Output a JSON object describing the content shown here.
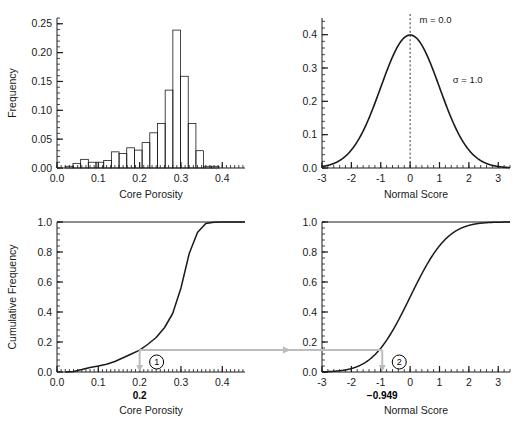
{
  "figure": {
    "title": "",
    "background": "#ffffff",
    "line_color": "#1a1a1a",
    "arrow_color": "#b3b3b3"
  },
  "panels": {
    "top_left": {
      "name": "core-porosity-histogram",
      "xlabel": "Core Porosity",
      "ylabel": "Frequency",
      "xticks": [
        "0.0",
        "0.1",
        "0.2",
        "0.3",
        "0.4"
      ],
      "yticks": [
        "0.00",
        "0.05",
        "0.10",
        "0.15",
        "0.20",
        "0.25"
      ]
    },
    "top_right": {
      "name": "normal-score-pdf",
      "xlabel": "Normal Score",
      "ylabel": "",
      "xticks": [
        "-3",
        "-2",
        "-1",
        "0",
        "1",
        "2",
        "3"
      ],
      "yticks": [
        "0.0",
        "0.1",
        "0.2",
        "0.3",
        "0.4"
      ],
      "annotation_mean": "m = 0.0",
      "annotation_sigma": "σ = 1.0"
    },
    "bottom_left": {
      "name": "core-porosity-cdf",
      "xlabel": "Core Porosity",
      "ylabel": "Cumulative Frequency",
      "xticks": [
        "0.0",
        "0.1",
        "0.2",
        "0.3",
        "0.4"
      ],
      "yticks": [
        "0.0",
        "0.2",
        "0.4",
        "0.6",
        "0.8",
        "1.0"
      ],
      "marker_label": "0.2",
      "step_number": "1"
    },
    "bottom_right": {
      "name": "normal-score-cdf",
      "xlabel": "Normal Score",
      "ylabel": "",
      "xticks": [
        "-3",
        "-2",
        "-1",
        "0",
        "1",
        "2",
        "3"
      ],
      "yticks": [
        "0.0",
        "0.2",
        "0.4",
        "0.6",
        "0.8",
        "1.0"
      ],
      "marker_label": "−0.949",
      "step_number": "2"
    }
  },
  "chart_data": [
    {
      "type": "bar",
      "id": "core-porosity-histogram",
      "title": "",
      "xlabel": "Core Porosity",
      "ylabel": "Frequency",
      "xlim": [
        0.0,
        0.455
      ],
      "ylim": [
        0.0,
        0.26
      ],
      "grid": false,
      "legend": false,
      "bin_width": 0.0186,
      "bin_starts": [
        0.02,
        0.0386,
        0.0572,
        0.0758,
        0.0944,
        0.113,
        0.1316,
        0.1502,
        0.1688,
        0.1874,
        0.206,
        0.2246,
        0.2432,
        0.2618,
        0.2804,
        0.299,
        0.3176,
        0.3362,
        0.3548,
        0.3734,
        0.392,
        0.4106
      ],
      "values": [
        0.003,
        0.008,
        0.015,
        0.01,
        0.01,
        0.013,
        0.028,
        0.025,
        0.035,
        0.031,
        0.044,
        0.061,
        0.077,
        0.135,
        0.239,
        0.159,
        0.077,
        0.03,
        0.003,
        0.003,
        0.0,
        0.0
      ]
    },
    {
      "type": "line",
      "id": "normal-score-pdf",
      "title": "",
      "xlabel": "Normal Score",
      "ylabel": "",
      "xlim": [
        -3.0,
        3.4
      ],
      "ylim": [
        0.0,
        0.45
      ],
      "grid": false,
      "legend": false,
      "annotations": [
        {
          "text": "m = 0.0",
          "x": 0.25,
          "y": 0.435
        },
        {
          "text": "σ = 1.0",
          "x": 1.45,
          "y": 0.255
        }
      ],
      "vline_x": 0.0,
      "distribution": "standard normal pdf, mean 0.0, sigma 1.0"
    },
    {
      "type": "line",
      "id": "core-porosity-cdf",
      "title": "",
      "xlabel": "Cumulative Frequency",
      "ylabel": "Cumulative Frequency",
      "xlim": [
        0.0,
        0.455
      ],
      "ylim": [
        0.0,
        1.0
      ],
      "grid": false,
      "legend": false,
      "x": [
        0.02,
        0.04,
        0.06,
        0.08,
        0.1,
        0.12,
        0.14,
        0.16,
        0.18,
        0.2,
        0.22,
        0.24,
        0.26,
        0.28,
        0.3,
        0.32,
        0.34,
        0.36,
        0.38,
        0.4,
        0.42
      ],
      "y": [
        0.0,
        0.004,
        0.016,
        0.03,
        0.04,
        0.052,
        0.07,
        0.095,
        0.12,
        0.146,
        0.185,
        0.23,
        0.295,
        0.39,
        0.56,
        0.79,
        0.93,
        0.99,
        0.998,
        1.0,
        1.0
      ],
      "marker_x": 0.2,
      "marker_y": 0.146,
      "marker_label": "0.2",
      "step_number": "1"
    },
    {
      "type": "line",
      "id": "normal-score-cdf",
      "title": "",
      "xlabel": "Normal Score",
      "ylabel": "",
      "xlim": [
        -3.0,
        3.4
      ],
      "ylim": [
        0.0,
        1.0
      ],
      "grid": false,
      "legend": false,
      "distribution": "standard normal cdf, mean 0.0, sigma 1.0",
      "marker_x": -0.949,
      "marker_y": 0.146,
      "marker_label": "−0.949",
      "step_number": "2"
    }
  ]
}
